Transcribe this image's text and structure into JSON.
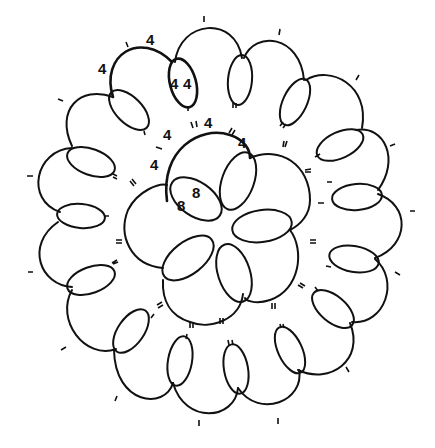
{
  "diagram": {
    "type": "tatting-pattern",
    "colors": {
      "line": "#111111",
      "background": "#ffffff"
    },
    "labels": [
      {
        "id": "outer-chain-a",
        "text": "4",
        "x": 146,
        "y": 32
      },
      {
        "id": "outer-chain-b",
        "text": "4",
        "x": 98,
        "y": 61
      },
      {
        "id": "outer-ring-left",
        "text": "4",
        "x": 170,
        "y": 76
      },
      {
        "id": "outer-ring-right",
        "text": "4",
        "x": 183,
        "y": 76
      },
      {
        "id": "center-chain-a",
        "text": "4",
        "x": 163,
        "y": 127
      },
      {
        "id": "center-chain-b",
        "text": "4",
        "x": 204,
        "y": 115
      },
      {
        "id": "center-chain-c",
        "text": "4",
        "x": 238,
        "y": 135
      },
      {
        "id": "center-chain-d",
        "text": "4",
        "x": 150,
        "y": 157
      },
      {
        "id": "center-ring-a",
        "text": "8",
        "x": 192,
        "y": 185
      },
      {
        "id": "center-ring-b",
        "text": "8",
        "x": 177,
        "y": 198
      }
    ]
  }
}
